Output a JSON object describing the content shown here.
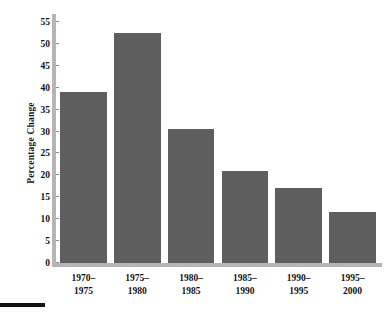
{
  "chart_data": {
    "type": "bar",
    "title": "",
    "subtitle": "",
    "xlabel": "",
    "ylabel": "Percentage Change",
    "categories": [
      "1970–\n1975",
      "1975–\n1980",
      "1980–\n1985",
      "1985–\n1990",
      "1990–\n1995",
      "1995–\n2000"
    ],
    "category_lines": [
      [
        "1970–",
        "1975"
      ],
      [
        "1975–",
        "1980"
      ],
      [
        "1980–",
        "1985"
      ],
      [
        "1985–",
        "1990"
      ],
      [
        "1990–",
        "1995"
      ],
      [
        "1995–",
        "2000"
      ]
    ],
    "values": [
      39.0,
      52.5,
      30.5,
      21.0,
      17.2,
      11.7
    ],
    "ylim": [
      0,
      55
    ],
    "yticks": [
      0,
      5,
      10,
      15,
      20,
      25,
      30,
      35,
      40,
      45,
      50,
      55
    ],
    "ytick_labels": [
      "0",
      "5",
      "10",
      "15",
      "20",
      "25",
      "30",
      "35",
      "40",
      "45",
      "50",
      "55"
    ],
    "grid": false,
    "legend": null,
    "bar_color": "#5e5e5e",
    "axis_color": "#b5b5b5",
    "text_color": "#141414",
    "background": "#ffffff",
    "rule_color": "#111111"
  }
}
